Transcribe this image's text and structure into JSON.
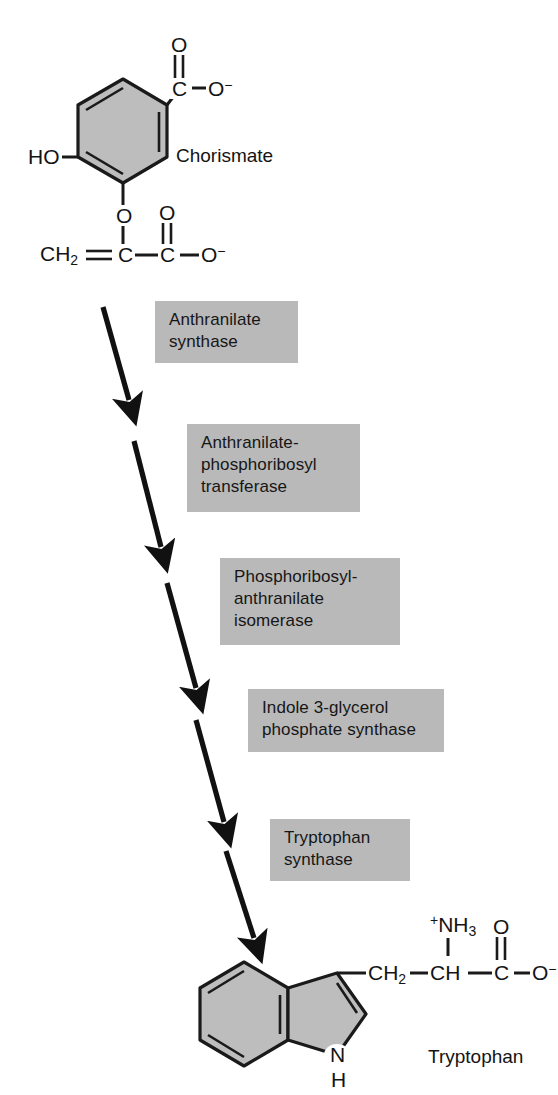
{
  "figure": {
    "background_color": "#ffffff",
    "ring_fill_color": "#bdbdbd",
    "ring_stroke_color": "#1a1a1a",
    "label_box_color": "#b9b9b9",
    "text_color": "#141414",
    "arrow_color": "#111111"
  },
  "substrate": {
    "name": "Chorismate",
    "atoms": {
      "carbonyl_o": "O",
      "carboxyl_c": "C",
      "carboxylate_o": "O",
      "carboxylate_charge": "−",
      "hydroxyl": "HO",
      "ether_o": "O",
      "enol_ch2": "CH",
      "enol_ch2_sub": "2",
      "enol_c": "C",
      "acid_c": "C",
      "acid_carbonyl_o": "O",
      "acid_o": "O",
      "acid_charge": "−"
    }
  },
  "product": {
    "name": "Tryptophan",
    "atoms": {
      "amino_n": "NH",
      "amino_sub": "3",
      "amino_charge": "+",
      "ch2": "CH",
      "ch2_sub": "2",
      "ch": "CH",
      "carboxyl_c": "C",
      "carbonyl_o": "O",
      "carboxylate_o": "O",
      "carboxylate_charge": "−",
      "indole_nh": "N",
      "indole_h": "H"
    }
  },
  "steps": [
    {
      "index": 1,
      "enzyme": "Anthranilate\nsynthase",
      "box": {
        "x": 155,
        "y": 301,
        "width": 143,
        "height": 62
      },
      "arrow": {
        "x1": 103,
        "y1": 307,
        "x2": 129,
        "y2": 400
      }
    },
    {
      "index": 2,
      "enzyme": "Anthranilate-\nphosphoribosyl\ntransferase",
      "box": {
        "x": 187,
        "y": 424,
        "width": 173,
        "height": 88
      },
      "arrow": {
        "x1": 134,
        "y1": 441,
        "x2": 161,
        "y2": 547
      }
    },
    {
      "index": 3,
      "enzyme": "Phosphoribosyl-\nanthranilate\nisomerase",
      "box": {
        "x": 220,
        "y": 558,
        "width": 180,
        "height": 87
      },
      "arrow": {
        "x1": 167,
        "y1": 583,
        "x2": 196,
        "y2": 688
      }
    },
    {
      "index": 4,
      "enzyme": "Indole 3-glycerol\nphosphate synthase",
      "box": {
        "x": 248,
        "y": 689,
        "width": 196,
        "height": 63
      },
      "arrow": {
        "x1": 196,
        "y1": 720,
        "x2": 224,
        "y2": 822
      }
    },
    {
      "index": 5,
      "enzyme": "Tryptophan\nsynthase",
      "box": {
        "x": 270,
        "y": 819,
        "width": 140,
        "height": 62
      },
      "arrow": {
        "x1": 226,
        "y1": 851,
        "x2": 254,
        "y2": 938
      }
    }
  ]
}
